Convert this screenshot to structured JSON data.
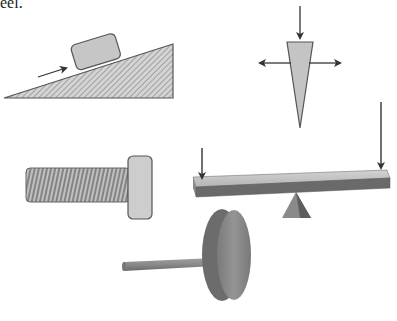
{
  "caption": {
    "fragment": "eel."
  },
  "figure": {
    "machines": [
      {
        "id": "inclined-plane",
        "label": "Inclined plane"
      },
      {
        "id": "wedge",
        "label": "Wedge"
      },
      {
        "id": "screw",
        "label": "Screw"
      },
      {
        "id": "lever",
        "label": "Lever"
      },
      {
        "id": "wheel-and-axle",
        "label": "Wheel and axle"
      }
    ]
  },
  "colors": {
    "outline": "#555555",
    "fill_light": "#c8c8c8",
    "fill_mid": "#a8a8a8",
    "fill_dark": "#6e6e6e",
    "arrow": "#333333",
    "background": "#ffffff"
  }
}
